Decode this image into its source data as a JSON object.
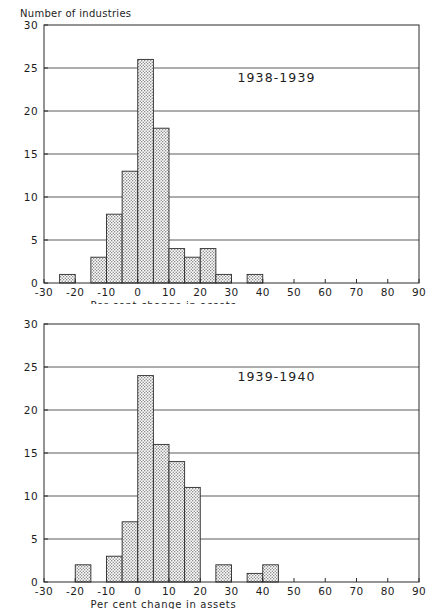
{
  "figure": {
    "background_color": "#ffffff",
    "ink_color": "#1d1d1d",
    "bar_fill_color": "#e2e2e2",
    "bar_edge_color": "#2b2b2b"
  },
  "chart_data": [
    {
      "type": "bar",
      "title": "1938-1939",
      "xlabel": "Per cent change in assets",
      "ylabel": "Number of industries",
      "xlim": [
        -30,
        90
      ],
      "ylim": [
        0,
        30
      ],
      "xticks": [
        -30,
        -20,
        -10,
        0,
        10,
        20,
        30,
        40,
        50,
        60,
        70,
        80,
        90
      ],
      "xtick_labels": [
        "-30",
        "-20",
        "-10",
        "0",
        "10",
        "20",
        "30",
        "40",
        "50",
        "60",
        "70",
        "80",
        "90"
      ],
      "yticks": [
        0,
        5,
        10,
        15,
        20,
        25,
        30
      ],
      "ytick_labels": [
        "0",
        "5",
        "10",
        "15",
        "20",
        "25",
        "30"
      ],
      "bin_width": 5,
      "grid": "horizontal",
      "legend": "none",
      "bins": [
        {
          "left": -25,
          "right": -20,
          "value": 1
        },
        {
          "left": -15,
          "right": -10,
          "value": 3
        },
        {
          "left": -10,
          "right": -5,
          "value": 8
        },
        {
          "left": -5,
          "right": 0,
          "value": 13
        },
        {
          "left": 0,
          "right": 5,
          "value": 26
        },
        {
          "left": 5,
          "right": 10,
          "value": 18
        },
        {
          "left": 10,
          "right": 15,
          "value": 4
        },
        {
          "left": 15,
          "right": 20,
          "value": 3
        },
        {
          "left": 20,
          "right": 25,
          "value": 4
        },
        {
          "left": 25,
          "right": 30,
          "value": 1
        },
        {
          "left": 35,
          "right": 40,
          "value": 1
        }
      ]
    },
    {
      "type": "bar",
      "title": "1939-1940",
      "xlabel": "Per cent change in assets",
      "ylabel": "",
      "xlim": [
        -30,
        90
      ],
      "ylim": [
        0,
        30
      ],
      "xticks": [
        -30,
        -20,
        -10,
        0,
        10,
        20,
        30,
        40,
        50,
        60,
        70,
        80,
        90
      ],
      "xtick_labels": [
        "-30",
        "-20",
        "-10",
        "0",
        "10",
        "20",
        "30",
        "40",
        "50",
        "60",
        "70",
        "80",
        "90"
      ],
      "yticks": [
        0,
        5,
        10,
        15,
        20,
        25,
        30
      ],
      "ytick_labels": [
        "0",
        "5",
        "10",
        "15",
        "20",
        "25",
        "30"
      ],
      "bin_width": 5,
      "grid": "horizontal",
      "legend": "none",
      "bins": [
        {
          "left": -20,
          "right": -15,
          "value": 2
        },
        {
          "left": -10,
          "right": -5,
          "value": 3
        },
        {
          "left": -5,
          "right": 0,
          "value": 7
        },
        {
          "left": 0,
          "right": 5,
          "value": 24
        },
        {
          "left": 5,
          "right": 10,
          "value": 16
        },
        {
          "left": 10,
          "right": 15,
          "value": 14
        },
        {
          "left": 15,
          "right": 20,
          "value": 11
        },
        {
          "left": 25,
          "right": 30,
          "value": 2
        },
        {
          "left": 35,
          "right": 40,
          "value": 1
        },
        {
          "left": 40,
          "right": 45,
          "value": 2
        }
      ]
    }
  ]
}
